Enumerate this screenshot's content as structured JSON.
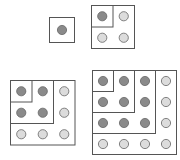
{
  "diagram": {
    "colors": {
      "border": "#555555",
      "dot_dark": "#8a8a8a",
      "dot_light": "#dcdcdc",
      "dot_stroke": "#666666"
    },
    "figures": [
      {
        "name": "square-1",
        "n": 1,
        "x": 49,
        "y": 17,
        "cell": 25
      },
      {
        "name": "square-2",
        "n": 2,
        "x": 91,
        "y": 5,
        "cell": 21.5
      },
      {
        "name": "square-3",
        "n": 3,
        "x": 10,
        "y": 80,
        "cell": 21.5
      },
      {
        "name": "square-4",
        "n": 4,
        "x": 92,
        "y": 70,
        "cell": 21
      }
    ]
  }
}
